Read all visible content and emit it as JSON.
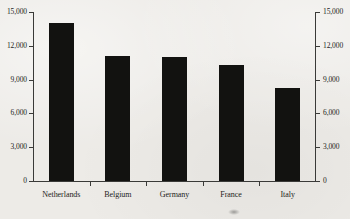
{
  "chart_data": {
    "type": "bar",
    "title": "",
    "xlabel": "",
    "ylabel": "",
    "categories": [
      "Netherlands",
      "Belgium",
      "Germany",
      "France",
      "Italy"
    ],
    "values": [
      14000,
      11100,
      11000,
      10300,
      8250
    ],
    "ylim": [
      0,
      15000
    ],
    "yticks": [
      0,
      3000,
      6000,
      9000,
      12000,
      15000
    ],
    "ytick_labels": [
      "0",
      "3,000",
      "6,000",
      "9,000",
      "12,000",
      "15,000"
    ],
    "grid": false,
    "legend": null,
    "legend_position": "none",
    "dual_axis": true,
    "right_axis_labels": [
      "0",
      "3,000",
      "6,000",
      "9,000",
      "12,000",
      "15,000"
    ],
    "bar_color": "#121210",
    "background_color": "#edebe7",
    "axis_color": "#3a3a38"
  }
}
